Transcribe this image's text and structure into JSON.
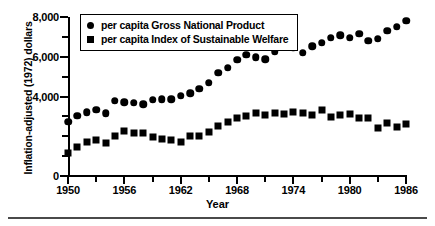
{
  "chart_data": {
    "type": "scatter",
    "title": "",
    "xlabel": "Year",
    "ylabel": "Inflation-adjusted (1972) dollars",
    "xlim": [
      1950,
      1986
    ],
    "ylim": [
      0,
      8000
    ],
    "grid": false,
    "legend_position": "top-left-inside",
    "x_tick_labels": [
      "1950",
      "1956",
      "1962",
      "1968",
      "1974",
      "1980",
      "1986"
    ],
    "x_tick_values": [
      1950,
      1956,
      1962,
      1968,
      1974,
      1980,
      1986
    ],
    "x_minor_tick_values": [
      1953,
      1959,
      1965,
      1971,
      1977,
      1983
    ],
    "y_tick_labels": [
      "0",
      "4,000",
      "6,000",
      "8,000"
    ],
    "y_tick_values": [
      0,
      4000,
      6000,
      8000
    ],
    "y_minor_tick_values": [
      1000,
      2000,
      3000,
      5000,
      7000
    ],
    "x": [
      1950,
      1951,
      1952,
      1953,
      1954,
      1955,
      1956,
      1957,
      1958,
      1959,
      1960,
      1961,
      1962,
      1963,
      1964,
      1965,
      1966,
      1967,
      1968,
      1969,
      1970,
      1971,
      1972,
      1973,
      1974,
      1975,
      1976,
      1977,
      1978,
      1979,
      1980,
      1981,
      1982,
      1983,
      1984,
      1985,
      1986
    ],
    "series": [
      {
        "name": "per capita Gross National Product",
        "marker": "circle",
        "color": "#000000",
        "values": [
          2720,
          3020,
          3220,
          3330,
          3150,
          3780,
          3700,
          3680,
          3620,
          3830,
          3870,
          3850,
          4050,
          4170,
          4400,
          4700,
          5200,
          5450,
          5850,
          6100,
          5980,
          5880,
          6250,
          6550,
          6450,
          6200,
          6520,
          6700,
          6950,
          7080,
          6950,
          7150,
          6800,
          6900,
          7300,
          7500,
          7800
        ]
      },
      {
        "name": "per capita Index of Sustainable Welfare",
        "marker": "square",
        "color": "#000000",
        "values": [
          1180,
          1480,
          1700,
          1820,
          1650,
          2000,
          2250,
          2180,
          2180,
          1950,
          1880,
          1800,
          1730,
          2030,
          2000,
          2200,
          2530,
          2740,
          2930,
          3000,
          3170,
          3050,
          3150,
          3120,
          3200,
          3150,
          3080,
          3300,
          2980,
          3080,
          3120,
          2900,
          2920,
          2400,
          2650,
          2480,
          2600
        ]
      }
    ]
  },
  "legend": {
    "entries": [
      {
        "label": "per capita Gross National Product",
        "marker": "circle"
      },
      {
        "label": "per capita Index of Sustainable Welfare",
        "marker": "square"
      }
    ]
  },
  "axes": {
    "ylabel": "Inflation-adjusted (1972) dollars",
    "xlabel": "Year"
  }
}
